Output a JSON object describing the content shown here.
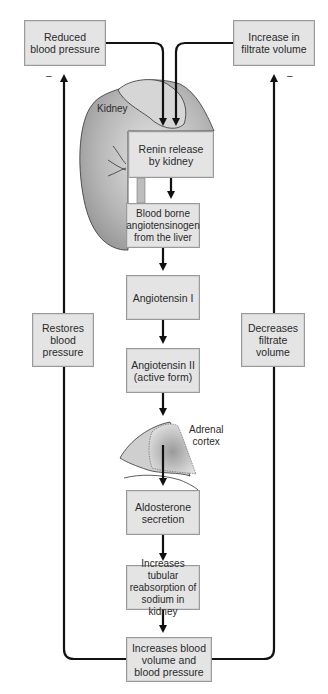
{
  "diagram": {
    "type": "flowchart",
    "topic": "Renin-angiotensin-aldosterone feedback",
    "triggers": [
      {
        "id": "reduced-bp",
        "label": "Reduced\nblood pressure",
        "feedback_sign": "–"
      },
      {
        "id": "increase-filtrate",
        "label": "Increase in\nfiltrate volume",
        "feedback_sign": "–"
      }
    ],
    "steps": [
      {
        "id": "renin",
        "label": "Renin release\nby kidney"
      },
      {
        "id": "angiotensinogen",
        "label": "Blood borne\nangiotensinogen\nfrom the liver"
      },
      {
        "id": "angiotensin-1",
        "label": "Angiotensin I"
      },
      {
        "id": "angiotensin-2",
        "label": "Angiotensin II\n(active form)"
      },
      {
        "id": "aldosterone",
        "label": "Aldosterone\nsecretion"
      },
      {
        "id": "tubular",
        "label": "Increases tubular\nreabsorption of\nsodium in kidney"
      },
      {
        "id": "blood-volume",
        "label": "Increases blood\nvolume and\nblood pressure"
      }
    ],
    "feedback": [
      {
        "id": "restores",
        "label": "Restores\nblood\npressure"
      },
      {
        "id": "decreases",
        "label": "Decreases\nfiltrate\nvolume"
      }
    ],
    "organ_labels": {
      "kidney": "Kidney",
      "adrenal": "Adrenal\ncortex"
    },
    "edges": [
      [
        "reduced-bp",
        "renin"
      ],
      [
        "increase-filtrate",
        "renin"
      ],
      [
        "renin",
        "angiotensinogen"
      ],
      [
        "angiotensinogen",
        "angiotensin-1"
      ],
      [
        "angiotensin-1",
        "angiotensin-2"
      ],
      [
        "angiotensin-2",
        "aldosterone"
      ],
      [
        "aldosterone",
        "tubular"
      ],
      [
        "tubular",
        "blood-volume"
      ],
      [
        "blood-volume",
        "restores"
      ],
      [
        "restores",
        "reduced-bp"
      ],
      [
        "blood-volume",
        "decreases"
      ],
      [
        "decreases",
        "increase-filtrate"
      ]
    ]
  }
}
